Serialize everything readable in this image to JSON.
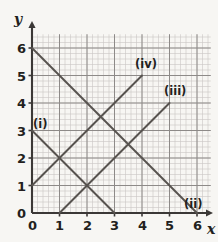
{
  "chart_data": {
    "type": "line",
    "title": "",
    "xlabel": "x",
    "ylabel": "y",
    "xlim": [
      0,
      6.5
    ],
    "ylim": [
      0,
      6.5
    ],
    "grid": true,
    "grid_minor_per_unit": 5,
    "legend_position": "inline-endpoint-labels",
    "xticks": [
      "0",
      "1",
      "2",
      "3",
      "4",
      "5",
      "6"
    ],
    "xtick_values": [
      0,
      1,
      2,
      3,
      4,
      5,
      6
    ],
    "yticks": [
      "0",
      "1",
      "2",
      "3",
      "4",
      "5",
      "6"
    ],
    "ytick_values": [
      0,
      1,
      2,
      3,
      4,
      5,
      6
    ],
    "series": [
      {
        "name": "(i)",
        "points": [
          [
            0,
            3
          ],
          [
            3,
            0
          ]
        ],
        "slope": -1,
        "intercept": 3,
        "label_at": [
          0.15,
          3.35
        ]
      },
      {
        "name": "(ii)",
        "points": [
          [
            0,
            6
          ],
          [
            6,
            0
          ]
        ],
        "slope": -1,
        "intercept": 6,
        "label_at": [
          5.7,
          0.45
        ]
      },
      {
        "name": "(iii)",
        "points": [
          [
            1,
            0
          ],
          [
            5,
            4
          ]
        ],
        "slope": 1,
        "intercept": -1,
        "label_at": [
          5.1,
          4.45
        ]
      },
      {
        "name": "(iv)",
        "points": [
          [
            0,
            1
          ],
          [
            4,
            5
          ]
        ],
        "slope": 1,
        "intercept": 1,
        "label_at": [
          4.1,
          5.45
        ]
      }
    ]
  },
  "axes": {
    "x_axis_name": "x",
    "y_axis_name": "y"
  },
  "colors": {
    "background": "#f7f6f3",
    "grid_minor": "#c9c6c4",
    "grid_major": "#8d8a88",
    "axis": "#3b3836",
    "line": "#57534f",
    "text": "#231f20"
  }
}
